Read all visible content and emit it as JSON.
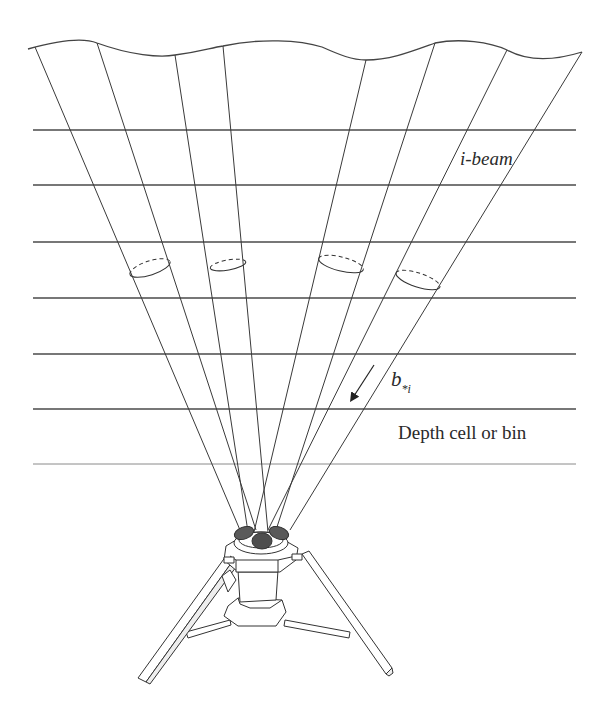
{
  "figure": {
    "labels": {
      "beam": "i-beam",
      "velocity_symbol": "b",
      "velocity_subscript": "*i",
      "depth_cell": "Depth cell or bin"
    },
    "colors": {
      "line": "#3a3a3a",
      "grid_line": "#4a4a4a",
      "transducer_fill": "#5a5a5a",
      "background": "#ffffff"
    },
    "surface": {
      "description": "wavy sea surface",
      "path": "M28,49 C60,40 85,38 97,43 C130,55 160,58 175,55 C200,52 210,48 223,46 C260,38 300,40 322,47 C340,55 352,60 366,60 C390,60 410,52 435,43 C460,38 490,42 507,50 C525,60 550,62 582,52"
    },
    "depth_lines_y": [
      130,
      185,
      242,
      298,
      354,
      409,
      464
    ],
    "depth_lines_x": [
      33,
      576
    ],
    "beams": [
      {
        "x1": 35,
        "y1": 47,
        "x2": 240,
        "y2": 530
      },
      {
        "x1": 97,
        "y1": 43,
        "x2": 256,
        "y2": 530
      },
      {
        "x1": 175,
        "y1": 55,
        "x2": 248,
        "y2": 532
      },
      {
        "x1": 223,
        "y1": 46,
        "x2": 268,
        "y2": 532
      },
      {
        "x1": 366,
        "y1": 60,
        "x2": 254,
        "y2": 532
      },
      {
        "x1": 435,
        "y1": 43,
        "x2": 276,
        "y2": 530
      },
      {
        "x1": 507,
        "y1": 50,
        "x2": 268,
        "y2": 530
      },
      {
        "x1": 582,
        "y1": 52,
        "x2": 290,
        "y2": 530
      }
    ],
    "beam_cross_sections": [
      {
        "cx": 150,
        "cy": 268,
        "rx": 21,
        "ry": 7,
        "rot": -18
      },
      {
        "cx": 228,
        "cy": 265,
        "rx": 18,
        "ry": 5,
        "rot": -10
      },
      {
        "cx": 341,
        "cy": 264,
        "rx": 23,
        "ry": 7,
        "rot": 14
      },
      {
        "cx": 418,
        "cy": 280,
        "rx": 23,
        "ry": 7,
        "rot": 18
      }
    ],
    "arrow": {
      "x1": 374,
      "y1": 365,
      "x2": 352,
      "y2": 399
    }
  }
}
